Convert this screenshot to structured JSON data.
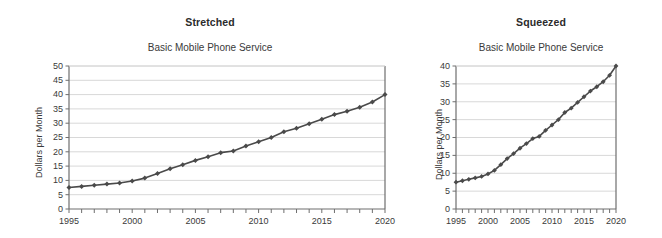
{
  "figure": {
    "background": "#ffffff",
    "line_color": "#4a4a4a",
    "grid_color": "#d8d8d8",
    "axis_color": "#6e6e6e"
  },
  "panels": [
    {
      "key": "stretched",
      "panel_label": "Stretched",
      "chart_title": "Basic Mobile Phone Service",
      "ylabel": "Dollars per Month",
      "y_ticks": [
        "0",
        "5",
        "10",
        "15",
        "20",
        "25",
        "30",
        "35",
        "40",
        "45",
        "50"
      ],
      "x_ticks": [
        "1995",
        "2000",
        "2005",
        "2010",
        "2015",
        "2020"
      ]
    },
    {
      "key": "squeezed",
      "panel_label": "Squeezed",
      "chart_title": "Basic Mobile Phone Service",
      "ylabel": "Dollars per Month",
      "y_ticks": [
        "0",
        "5",
        "10",
        "15",
        "20",
        "25",
        "30",
        "35",
        "40"
      ],
      "x_ticks": [
        "1995",
        "2000",
        "2005",
        "2010",
        "2015",
        "2020"
      ]
    }
  ],
  "chart_data": [
    {
      "type": "line",
      "title": "Basic Mobile Phone Service",
      "panel_label": "Stretched",
      "xlabel": "",
      "ylabel": "Dollars per Month",
      "xlim": [
        1995,
        2020
      ],
      "ylim": [
        0,
        50
      ],
      "ytick_step": 5,
      "xtick_step": 1,
      "xtick_label_step": 5,
      "grid": "horizontal",
      "legend": "none",
      "markers": "diamond",
      "x": [
        1995,
        1996,
        1997,
        1998,
        1999,
        2000,
        2001,
        2002,
        2003,
        2004,
        2005,
        2006,
        2007,
        2008,
        2009,
        2010,
        2011,
        2012,
        2013,
        2014,
        2015,
        2016,
        2017,
        2018,
        2019,
        2020
      ],
      "values": [
        7.5,
        7.9,
        8.3,
        8.7,
        9.1,
        9.8,
        10.8,
        12.4,
        14.1,
        15.5,
        17.0,
        18.3,
        19.7,
        20.3,
        22.0,
        23.5,
        25.0,
        27.0,
        28.2,
        29.8,
        31.4,
        33.0,
        34.2,
        35.6,
        37.4,
        40.0
      ]
    },
    {
      "type": "line",
      "title": "Basic Mobile Phone Service",
      "panel_label": "Squeezed",
      "xlabel": "",
      "ylabel": "Dollars per Month",
      "xlim": [
        1995,
        2020
      ],
      "ylim": [
        0,
        40
      ],
      "ytick_step": 5,
      "xtick_step": 1,
      "xtick_label_step": 5,
      "grid": "horizontal",
      "legend": "none",
      "markers": "diamond",
      "x": [
        1995,
        1996,
        1997,
        1998,
        1999,
        2000,
        2001,
        2002,
        2003,
        2004,
        2005,
        2006,
        2007,
        2008,
        2009,
        2010,
        2011,
        2012,
        2013,
        2014,
        2015,
        2016,
        2017,
        2018,
        2019,
        2020
      ],
      "values": [
        7.5,
        7.9,
        8.3,
        8.7,
        9.1,
        9.8,
        10.8,
        12.4,
        14.1,
        15.5,
        17.0,
        18.3,
        19.7,
        20.3,
        22.0,
        23.5,
        25.0,
        27.0,
        28.2,
        29.8,
        31.4,
        33.0,
        34.2,
        35.6,
        37.4,
        40.0
      ]
    }
  ]
}
